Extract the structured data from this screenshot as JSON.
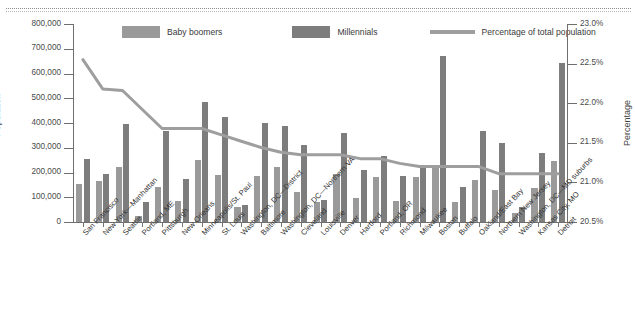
{
  "chart_data": {
    "type": "bar",
    "title": "",
    "subtitle": "",
    "xlabel": "",
    "ylabel": "Population",
    "y2label": "Percentage",
    "ylim": [
      0,
      800000
    ],
    "y2lim": [
      20.5,
      23.0
    ],
    "ytick_labels": [
      "800,000",
      "700,000",
      "600,000",
      "500,000",
      "400,000",
      "300,000",
      "200,000",
      "100,000",
      "0"
    ],
    "ytick_values": [
      800000,
      700000,
      600000,
      500000,
      400000,
      300000,
      200000,
      100000,
      0
    ],
    "y2tick_labels": [
      "23.0%",
      "22.5%",
      "22.0%",
      "21.5%",
      "21.0%",
      "20.5%"
    ],
    "y2tick_values": [
      23.0,
      22.5,
      22.0,
      21.5,
      21.0,
      20.5
    ],
    "grid": false,
    "legend_position": "top",
    "categories": [
      "San Francisco",
      "New York—Manhattan",
      "Seattle",
      "Portland, ME",
      "Pittsburgh",
      "New Orleans",
      "Minneapolis/St. Paul",
      "St. Louis",
      "Washington, DC—District",
      "Baltimore",
      "Washington, DC—Northern VA",
      "Cleveland",
      "Louisville",
      "Denver",
      "Hartford",
      "Portland, OR",
      "Richmond",
      "Milwaukee",
      "Boston",
      "Buffalo",
      "Oakland/East Bay",
      "Northern New Jersey",
      "Washington, DC—MD suburbs",
      "Kansas City, MO",
      "Detroit"
    ],
    "series": [
      {
        "name": "Baby boomers",
        "color": "#9a9a9a",
        "values": [
          155000,
          165000,
          222000,
          25000,
          140000,
          86000,
          250000,
          188000,
          62000,
          187000,
          224000,
          120000,
          82000,
          195000,
          97000,
          180000,
          85000,
          182000,
          218000,
          80000,
          168000,
          128000,
          37000,
          137000,
          245000
        ]
      },
      {
        "name": "Millennials",
        "color": "#7d7d7d",
        "values": [
          256000,
          192000,
          395000,
          80000,
          368000,
          172000,
          484000,
          424000,
          68000,
          400000,
          386000,
          312000,
          88000,
          358000,
          210000,
          265000,
          185000,
          228000,
          672000,
          140000,
          368000,
          318000,
          62000,
          278000,
          642000
        ]
      },
      {
        "name": "Percentage of total population",
        "type": "line",
        "color": "#9e9e9e",
        "axis": "right",
        "values": [
          22.55,
          22.18,
          22.16,
          21.92,
          21.68,
          21.68,
          21.68,
          21.6,
          21.52,
          21.44,
          21.38,
          21.35,
          21.35,
          21.35,
          21.3,
          21.3,
          21.24,
          21.2,
          21.2,
          21.2,
          21.2,
          21.11,
          21.11,
          21.11,
          21.11
        ]
      }
    ]
  },
  "legend": {
    "items": [
      {
        "label": "Baby boomers",
        "kind": "swatch",
        "color": "#9a9a9a"
      },
      {
        "label": "Millennials",
        "kind": "swatch",
        "color": "#7d7d7d"
      },
      {
        "label": "Percentage of total population",
        "kind": "line",
        "color": "#9e9e9e"
      }
    ]
  }
}
